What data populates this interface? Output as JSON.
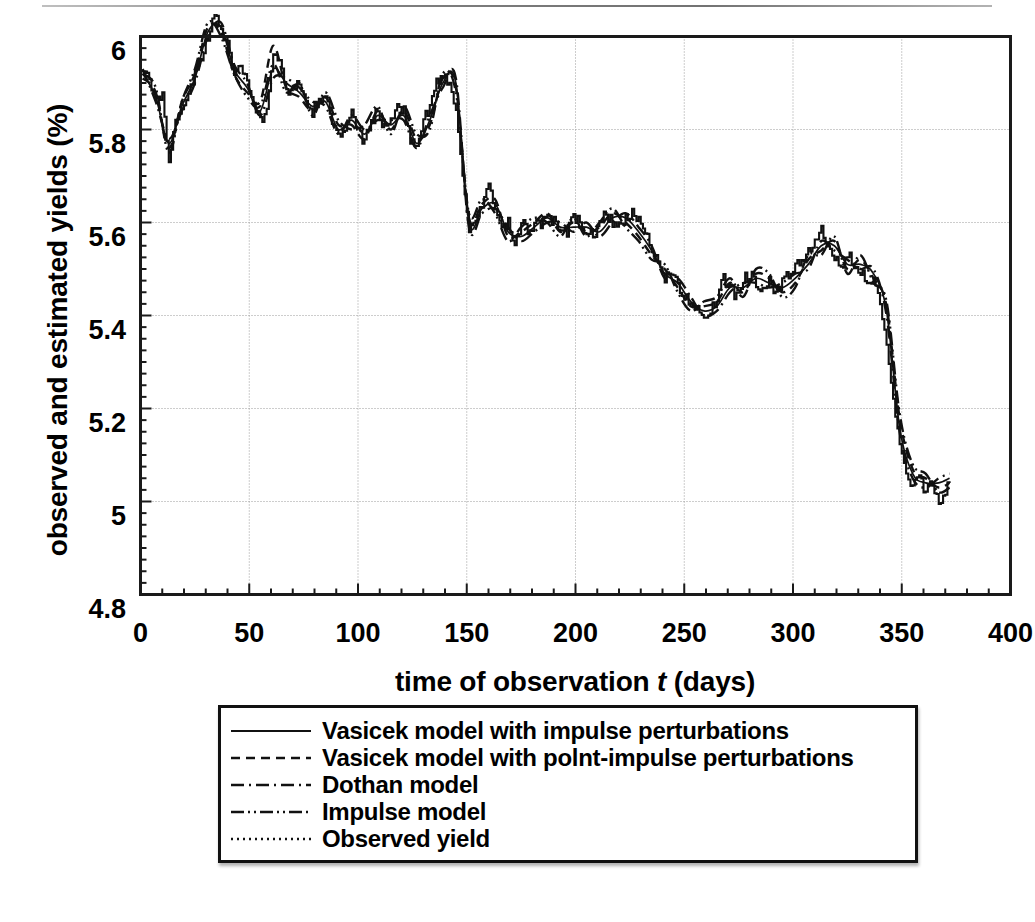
{
  "figure": {
    "ylabel": "observed and estimated yields (%)",
    "xlabel_prefix": "time of observation ",
    "xlabel_var": "t",
    "xlabel_suffix": " (days)"
  },
  "axes": {
    "y_ticks": [
      "6",
      "5.8",
      "5.6",
      "5.4",
      "5.2",
      "5",
      "4.8"
    ],
    "x_ticks": [
      "0",
      "50",
      "100",
      "150",
      "200",
      "250",
      "300",
      "350",
      "400"
    ]
  },
  "legend": {
    "items": [
      {
        "label": "Vasicek model with impulse perturbations",
        "style": "solid"
      },
      {
        "label": "Vasicek model with polnt-impulse perturbations",
        "style": "dashed"
      },
      {
        "label": "Dothan model",
        "style": "dash-dot"
      },
      {
        "label": "Impulse model",
        "style": "dash-dot-dot"
      },
      {
        "label": "Observed yield",
        "style": "dotted"
      }
    ]
  },
  "colors": {
    "ink": "#111111",
    "grid": "#9a9a9a",
    "frame": "#1a1a1a",
    "background": "#ffffff"
  },
  "chart_data": {
    "type": "line",
    "title": "",
    "xlabel": "time of observation t (days)",
    "ylabel": "observed and estimated yields (%)",
    "xlim": [
      0,
      400
    ],
    "ylim": [
      4.8,
      6.0
    ],
    "xticks": [
      0,
      50,
      100,
      150,
      200,
      250,
      300,
      350,
      400
    ],
    "yticks": [
      4.8,
      5.0,
      5.2,
      5.4,
      5.6,
      5.8,
      6.0
    ],
    "grid": true,
    "legend_position": "below-plot",
    "x_data_range": [
      1,
      372
    ],
    "series": [
      {
        "name": "Observed yield",
        "style": "step-dotted",
        "note": "noisy daily observations drawn as step/spike series",
        "x": [
          1,
          4,
          7,
          10,
          13,
          16,
          19,
          22,
          25,
          28,
          31,
          34,
          37,
          40,
          43,
          46,
          49,
          52,
          55,
          58,
          61,
          64,
          67,
          70,
          73,
          76,
          79,
          82,
          85,
          88,
          91,
          94,
          97,
          100,
          103,
          106,
          109,
          112,
          115,
          118,
          121,
          124,
          127,
          130,
          133,
          136,
          139,
          142,
          145,
          148,
          151,
          154,
          157,
          160,
          163,
          166,
          169,
          172,
          175,
          178,
          181,
          184,
          187,
          190,
          193,
          196,
          199,
          202,
          205,
          208,
          211,
          214,
          217,
          220,
          223,
          226,
          229,
          232,
          235,
          238,
          241,
          244,
          247,
          250,
          253,
          256,
          259,
          262,
          265,
          268,
          271,
          274,
          277,
          280,
          283,
          286,
          289,
          292,
          295,
          298,
          301,
          304,
          307,
          310,
          313,
          316,
          319,
          322,
          325,
          328,
          331,
          334,
          337,
          340,
          343,
          346,
          349,
          352,
          355,
          358,
          361,
          364,
          367,
          370,
          372
        ],
        "y": [
          5.93,
          5.9,
          5.86,
          5.88,
          5.73,
          5.82,
          5.85,
          5.88,
          5.92,
          5.95,
          6.0,
          6.05,
          6.02,
          5.99,
          5.92,
          5.94,
          5.9,
          5.86,
          5.82,
          5.84,
          5.97,
          5.95,
          5.88,
          5.9,
          5.89,
          5.85,
          5.84,
          5.86,
          5.88,
          5.82,
          5.78,
          5.8,
          5.83,
          5.8,
          5.77,
          5.82,
          5.84,
          5.8,
          5.82,
          5.86,
          5.84,
          5.78,
          5.76,
          5.82,
          5.85,
          5.9,
          5.92,
          5.9,
          5.84,
          5.7,
          5.59,
          5.61,
          5.63,
          5.68,
          5.63,
          5.58,
          5.6,
          5.54,
          5.6,
          5.58,
          5.6,
          5.59,
          5.62,
          5.6,
          5.59,
          5.58,
          5.61,
          5.6,
          5.58,
          5.57,
          5.6,
          5.62,
          5.6,
          5.59,
          5.61,
          5.62,
          5.6,
          5.58,
          5.53,
          5.52,
          5.48,
          5.5,
          5.46,
          5.44,
          5.43,
          5.42,
          5.4,
          5.41,
          5.43,
          5.48,
          5.46,
          5.44,
          5.48,
          5.49,
          5.47,
          5.46,
          5.48,
          5.44,
          5.47,
          5.49,
          5.5,
          5.52,
          5.54,
          5.56,
          5.58,
          5.55,
          5.52,
          5.5,
          5.53,
          5.51,
          5.5,
          5.48,
          5.47,
          5.42,
          5.34,
          5.22,
          5.12,
          5.06,
          5.03,
          5.05,
          5.02,
          5.04,
          4.99,
          5.02,
          5.04
        ]
      },
      {
        "name": "Vasicek model with impulse perturbations",
        "style": "solid",
        "x": [
          1,
          7,
          13,
          19,
          25,
          31,
          37,
          43,
          49,
          55,
          61,
          67,
          73,
          79,
          85,
          91,
          97,
          103,
          109,
          115,
          121,
          127,
          133,
          139,
          145,
          151,
          157,
          163,
          169,
          175,
          181,
          187,
          193,
          199,
          205,
          211,
          217,
          223,
          229,
          235,
          241,
          247,
          253,
          259,
          265,
          271,
          277,
          283,
          289,
          295,
          301,
          307,
          313,
          319,
          325,
          331,
          337,
          343,
          349,
          355,
          361,
          367,
          372
        ],
        "y": [
          5.92,
          5.87,
          5.77,
          5.85,
          5.91,
          6.01,
          6.02,
          5.93,
          5.89,
          5.84,
          5.93,
          5.9,
          5.88,
          5.85,
          5.86,
          5.8,
          5.82,
          5.79,
          5.83,
          5.81,
          5.83,
          5.77,
          5.82,
          5.9,
          5.9,
          5.6,
          5.63,
          5.64,
          5.58,
          5.57,
          5.59,
          5.61,
          5.59,
          5.59,
          5.59,
          5.58,
          5.61,
          5.61,
          5.58,
          5.54,
          5.49,
          5.47,
          5.43,
          5.41,
          5.42,
          5.46,
          5.46,
          5.48,
          5.47,
          5.46,
          5.48,
          5.51,
          5.55,
          5.55,
          5.51,
          5.51,
          5.49,
          5.41,
          5.16,
          5.06,
          5.04,
          5.04,
          5.05
        ]
      },
      {
        "name": "Vasicek model with polnt-impulse perturbations",
        "style": "dashed",
        "x": [
          1,
          7,
          13,
          19,
          25,
          31,
          37,
          43,
          49,
          55,
          61,
          67,
          73,
          79,
          85,
          91,
          97,
          103,
          109,
          115,
          121,
          127,
          133,
          139,
          145,
          151,
          157,
          163,
          169,
          175,
          181,
          187,
          193,
          199,
          205,
          211,
          217,
          223,
          229,
          235,
          241,
          247,
          253,
          259,
          265,
          271,
          277,
          283,
          289,
          295,
          301,
          307,
          313,
          319,
          325,
          331,
          337,
          343,
          349,
          355,
          361,
          367,
          372
        ],
        "y": [
          5.91,
          5.88,
          5.76,
          5.86,
          5.92,
          6.02,
          6.01,
          5.92,
          5.88,
          5.86,
          5.98,
          5.89,
          5.87,
          5.84,
          5.87,
          5.81,
          5.81,
          5.78,
          5.84,
          5.8,
          5.84,
          5.78,
          5.81,
          5.91,
          5.89,
          5.61,
          5.64,
          5.65,
          5.57,
          5.58,
          5.6,
          5.62,
          5.58,
          5.6,
          5.58,
          5.59,
          5.62,
          5.6,
          5.57,
          5.53,
          5.5,
          5.46,
          5.42,
          5.42,
          5.43,
          5.47,
          5.45,
          5.49,
          5.48,
          5.45,
          5.47,
          5.52,
          5.54,
          5.56,
          5.5,
          5.52,
          5.48,
          5.42,
          5.18,
          5.07,
          5.05,
          5.03,
          5.04
        ]
      },
      {
        "name": "Dothan model",
        "style": "dash-dot",
        "x": [
          1,
          7,
          13,
          19,
          25,
          31,
          37,
          43,
          49,
          55,
          61,
          67,
          73,
          79,
          85,
          91,
          97,
          103,
          109,
          115,
          121,
          127,
          133,
          139,
          145,
          151,
          157,
          163,
          169,
          175,
          181,
          187,
          193,
          199,
          205,
          211,
          217,
          223,
          229,
          235,
          241,
          247,
          253,
          259,
          265,
          271,
          277,
          283,
          289,
          295,
          301,
          307,
          313,
          319,
          325,
          331,
          337,
          343,
          349,
          355,
          361,
          367,
          372
        ],
        "y": [
          5.93,
          5.86,
          5.78,
          5.84,
          5.9,
          6.0,
          6.03,
          5.94,
          5.9,
          5.83,
          5.91,
          5.91,
          5.89,
          5.86,
          5.85,
          5.79,
          5.83,
          5.8,
          5.82,
          5.82,
          5.82,
          5.76,
          5.83,
          5.89,
          5.91,
          5.59,
          5.62,
          5.63,
          5.59,
          5.56,
          5.58,
          5.6,
          5.6,
          5.58,
          5.6,
          5.57,
          5.6,
          5.62,
          5.59,
          5.55,
          5.48,
          5.48,
          5.44,
          5.4,
          5.41,
          5.45,
          5.47,
          5.47,
          5.46,
          5.47,
          5.49,
          5.5,
          5.56,
          5.54,
          5.52,
          5.5,
          5.5,
          5.4,
          5.15,
          5.05,
          5.03,
          5.05,
          5.06
        ]
      },
      {
        "name": "Impulse model",
        "style": "dash-dot-dot",
        "x": [
          1,
          7,
          13,
          19,
          25,
          31,
          37,
          43,
          49,
          55,
          61,
          67,
          73,
          79,
          85,
          91,
          97,
          103,
          109,
          115,
          121,
          127,
          133,
          139,
          145,
          151,
          157,
          163,
          169,
          175,
          181,
          187,
          193,
          199,
          205,
          211,
          217,
          223,
          229,
          235,
          241,
          247,
          253,
          259,
          265,
          271,
          277,
          283,
          289,
          295,
          301,
          307,
          313,
          319,
          325,
          331,
          337,
          343,
          349,
          355,
          361,
          367,
          372
        ],
        "y": [
          5.92,
          5.89,
          5.75,
          5.86,
          5.93,
          6.03,
          6.0,
          5.92,
          5.87,
          5.85,
          5.94,
          5.88,
          5.9,
          5.83,
          5.88,
          5.82,
          5.8,
          5.81,
          5.85,
          5.79,
          5.85,
          5.79,
          5.8,
          5.92,
          5.88,
          5.62,
          5.65,
          5.62,
          5.56,
          5.59,
          5.61,
          5.6,
          5.57,
          5.61,
          5.57,
          5.6,
          5.63,
          5.59,
          5.56,
          5.52,
          5.51,
          5.45,
          5.41,
          5.43,
          5.44,
          5.48,
          5.44,
          5.5,
          5.49,
          5.44,
          5.46,
          5.53,
          5.53,
          5.57,
          5.49,
          5.53,
          5.47,
          5.43,
          5.19,
          5.08,
          5.06,
          5.02,
          5.03
        ]
      }
    ]
  }
}
